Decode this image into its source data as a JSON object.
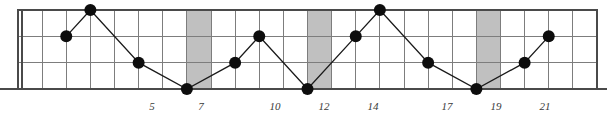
{
  "chart_data": {
    "type": "line",
    "title": "",
    "subtitle": "",
    "xlabel": "",
    "ylabel": "",
    "grid": true,
    "legend": null,
    "xlim": [
      0,
      24
    ],
    "ylim": [
      0,
      3
    ],
    "x_tick_labels": [
      "5",
      "7",
      "10",
      "12",
      "14",
      "17",
      "19",
      "21"
    ],
    "x_tick_values": [
      5,
      7,
      10,
      12,
      14,
      17,
      19,
      21
    ],
    "y_tick_labels": [],
    "x": [
      2,
      3,
      5,
      7,
      9,
      10,
      12,
      14,
      15,
      17,
      19,
      21,
      22
    ],
    "y": [
      2,
      3,
      1,
      0,
      1,
      2,
      0,
      2,
      3,
      1,
      0,
      1,
      2
    ],
    "series": [
      {
        "name": "series-1",
        "marker": "filled-circle",
        "points": [
          {
            "x": 2,
            "y": 2
          },
          {
            "x": 3,
            "y": 3
          },
          {
            "x": 5,
            "y": 1
          },
          {
            "x": 7,
            "y": 0
          },
          {
            "x": 9,
            "y": 1
          },
          {
            "x": 10,
            "y": 2
          },
          {
            "x": 12,
            "y": 0
          },
          {
            "x": 14,
            "y": 2
          },
          {
            "x": 15,
            "y": 3
          },
          {
            "x": 17,
            "y": 1
          },
          {
            "x": 19,
            "y": 0
          },
          {
            "x": 21,
            "y": 1
          },
          {
            "x": 22,
            "y": 2
          }
        ]
      }
    ],
    "shaded_columns": [
      {
        "index": 7,
        "label": "7"
      },
      {
        "index": 12,
        "label": "12"
      },
      {
        "index": 19,
        "label": "19"
      }
    ],
    "annotations": []
  },
  "style": {
    "grid_color": "#7d7d7d",
    "border_color": "#4a4a4a",
    "marker_color": "#0d0d0d",
    "line_color": "#1a1a1a",
    "shade_color": "#c0c0c0",
    "label_color": "#3a3a3a",
    "background": "#ffffff"
  },
  "geometry": {
    "plot_left": 18,
    "plot_right": 597,
    "plot_top": 10,
    "plot_bottom": 89,
    "column_count": 24,
    "row_count": 3,
    "marker_radius": 6
  },
  "axis_labels": [
    {
      "text": "5",
      "x": 152
    },
    {
      "text": "7",
      "x": 201
    },
    {
      "text": "10",
      "x": 275
    },
    {
      "text": "12",
      "x": 324
    },
    {
      "text": "14",
      "x": 373
    },
    {
      "text": "17",
      "x": 447
    },
    {
      "text": "19",
      "x": 496
    },
    {
      "text": "21",
      "x": 545
    }
  ]
}
